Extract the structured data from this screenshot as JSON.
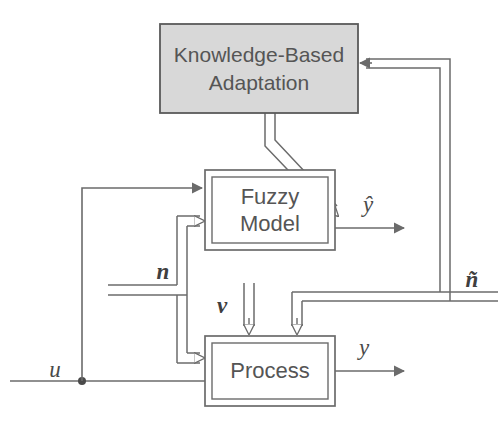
{
  "figure": {
    "type": "block-diagram",
    "background_color": "#ffffff",
    "line_color": "#6b6b6b",
    "text_color": "#555555"
  },
  "blocks": {
    "kba": {
      "label_line1": "Knowledge-Based",
      "label_line2": "Adaptation",
      "fill_color": "#d8d8d8",
      "border_color": "#5a5a5a",
      "x": 160,
      "y": 24,
      "width": 198,
      "height": 89
    },
    "fuzzy_model": {
      "label_line1": "Fuzzy",
      "label_line2": "Model",
      "fill_color": "#ffffff",
      "border_color": "#6b6b6b",
      "x": 205,
      "y": 170,
      "width": 130,
      "height": 80
    },
    "process": {
      "label_line1": "Process",
      "label_line2": "",
      "fill_color": "#ffffff",
      "border_color": "#6b6b6b",
      "x": 205,
      "y": 336,
      "width": 130,
      "height": 70
    }
  },
  "signals": {
    "u": {
      "label": "u",
      "x": 55,
      "y": 372
    },
    "n": {
      "label": "n",
      "x": 163,
      "y": 274
    },
    "v": {
      "label": "v",
      "x": 222,
      "y": 308
    },
    "y_hat": {
      "label": "ŷ",
      "x": 368,
      "y": 207
    },
    "y": {
      "label": "y",
      "x": 364,
      "y": 350
    },
    "n_tilde": {
      "label": "ñ",
      "x": 472,
      "y": 282
    }
  },
  "connections": [
    {
      "name": "u-to-process",
      "style": "single-line",
      "from": "u-input",
      "to": "process-lower-input"
    },
    {
      "name": "u-branch-to-fuzzy-model",
      "style": "single-line",
      "from": "u-junction",
      "to": "fuzzy-model-upper-input"
    },
    {
      "name": "n-to-fuzzy-model",
      "style": "double-line",
      "from": "n-input",
      "to": "fuzzy-model-lower-input"
    },
    {
      "name": "n-to-process",
      "style": "double-line",
      "from": "n-input",
      "to": "process-upper-input"
    },
    {
      "name": "kba-to-fuzzy-model",
      "style": "double-line-diagonal",
      "from": "kba-bottom",
      "to": "fuzzy-model-interior"
    },
    {
      "name": "fuzzy-model-output-y-hat",
      "style": "single-line",
      "from": "fuzzy-model-right",
      "to": "y-hat"
    },
    {
      "name": "process-output-y",
      "style": "single-line",
      "from": "process-right",
      "to": "y"
    },
    {
      "name": "n-tilde-feedback-to-kba",
      "style": "double-line",
      "from": "n-tilde-bus",
      "to": "kba-right-input"
    },
    {
      "name": "n-tilde-branch-to-process",
      "style": "double-line",
      "from": "n-tilde-bus",
      "to": "process-upper-input-right"
    }
  ]
}
